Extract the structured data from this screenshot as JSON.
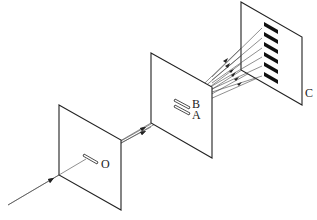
{
  "diagram": {
    "type": "double-slit interference setup",
    "labels": {
      "source_slit": "O",
      "slit_upper": "B",
      "slit_lower": "A",
      "screen": "C"
    },
    "screen_fringe_count": 6,
    "colors": {
      "line": "#222222",
      "fringe": "#111111",
      "background": "#ffffff"
    }
  }
}
